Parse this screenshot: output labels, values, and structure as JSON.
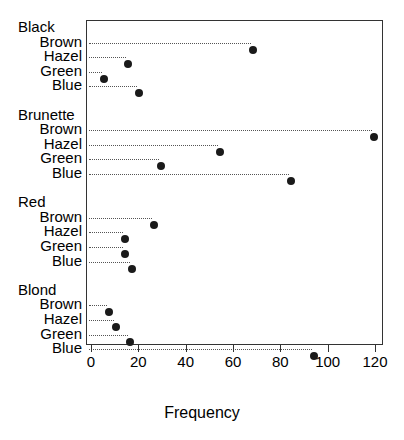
{
  "chart_data": {
    "type": "dotchart",
    "title": "",
    "subtitle": "",
    "xlabel": "Frequency",
    "ylabel": "",
    "xlim": [
      0,
      125
    ],
    "xticks": [
      0,
      20,
      40,
      60,
      80,
      100,
      120
    ],
    "xticklabels": [
      "0",
      "20",
      "40",
      "60",
      "80",
      "100",
      "120"
    ],
    "grid": false,
    "legend": null,
    "dot_color": "#1a1a1a",
    "leader_line_style": "dotted",
    "groups": [
      {
        "name": "Black",
        "categories": [
          "Brown",
          "Hazel",
          "Green",
          "Blue"
        ],
        "values": [
          68,
          15,
          5,
          20
        ]
      },
      {
        "name": "Brunette",
        "categories": [
          "Brown",
          "Hazel",
          "Green",
          "Blue"
        ],
        "values": [
          119,
          54,
          29,
          84
        ]
      },
      {
        "name": "Red",
        "categories": [
          "Brown",
          "Hazel",
          "Green",
          "Blue"
        ],
        "values": [
          26,
          14,
          14,
          17
        ]
      },
      {
        "name": "Blond",
        "categories": [
          "Brown",
          "Hazel",
          "Green",
          "Blue"
        ],
        "values": [
          7,
          10,
          16,
          94
        ]
      }
    ]
  },
  "axis": {
    "title": "Frequency"
  }
}
